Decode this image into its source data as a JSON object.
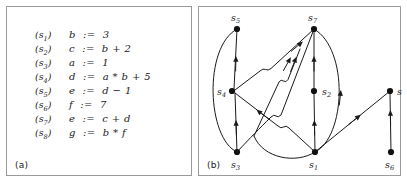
{
  "figure": {
    "panels": [
      {
        "id": "a",
        "label": "(a)"
      },
      {
        "id": "b",
        "label": "(b)"
      }
    ]
  },
  "statements": {
    "caption": "(a)",
    "rows": [
      {
        "tag": "s",
        "index": "1",
        "text": "b  :=  3"
      },
      {
        "tag": "s",
        "index": "2",
        "text": "c  :=  b + 2"
      },
      {
        "tag": "s",
        "index": "3",
        "text": "a  :=  1"
      },
      {
        "tag": "s",
        "index": "4",
        "text": "d  :=  a * b + 5"
      },
      {
        "tag": "s",
        "index": "5",
        "text": "e  :=  d − 1"
      },
      {
        "tag": "s",
        "index": "6",
        "text": "f  :=  7"
      },
      {
        "tag": "s",
        "index": "7",
        "text": "e  :=  c + d"
      },
      {
        "tag": "s",
        "index": "8",
        "text": "g  :=  b * f"
      }
    ]
  },
  "graph": {
    "caption": "(b)",
    "node_color": "#111111",
    "edge_color": "#1a1a1a",
    "nodes": [
      {
        "id": "s5",
        "label": "s",
        "sub": "5",
        "x": 38,
        "y": 22,
        "lx": 32,
        "ly": 13
      },
      {
        "id": "s7",
        "label": "s",
        "sub": "7",
        "x": 115,
        "y": 22,
        "lx": 109,
        "ly": 13
      },
      {
        "id": "s4",
        "label": "s",
        "sub": "4",
        "x": 33,
        "y": 84,
        "lx": 18,
        "ly": 88
      },
      {
        "id": "s2",
        "label": "s",
        "sub": "2",
        "x": 115,
        "y": 84,
        "lx": 122,
        "ly": 88
      },
      {
        "id": "s8",
        "label": "s",
        "sub": "8",
        "x": 191,
        "y": 84,
        "lx": 197,
        "ly": 88
      },
      {
        "id": "s3",
        "label": "s",
        "sub": "3",
        "x": 38,
        "y": 145,
        "lx": 32,
        "ly": 160
      },
      {
        "id": "s1",
        "label": "s",
        "sub": "1",
        "x": 116,
        "y": 145,
        "lx": 110,
        "ly": 160
      },
      {
        "id": "s6",
        "label": "s",
        "sub": "6",
        "x": 192,
        "y": 145,
        "lx": 186,
        "ly": 160
      }
    ],
    "edges": [
      {
        "from": "s3",
        "to": "s4",
        "kind": "line"
      },
      {
        "from": "s4",
        "to": "s5",
        "kind": "line"
      },
      {
        "from": "s3",
        "to": "s5",
        "kind": "curve-left"
      },
      {
        "from": "s1",
        "to": "s2",
        "kind": "line"
      },
      {
        "from": "s2",
        "to": "s7",
        "kind": "line"
      },
      {
        "from": "s1",
        "to": "s7",
        "kind": "curve-right"
      },
      {
        "from": "s6",
        "to": "s8",
        "kind": "line"
      },
      {
        "from": "s1",
        "to": "s8",
        "kind": "diagonal"
      },
      {
        "from": "s4",
        "to": "s7",
        "kind": "diagonal"
      },
      {
        "from": "s3",
        "to": "s7",
        "kind": "diagonal"
      },
      {
        "from": "s1",
        "to": "s4",
        "kind": "diagonal"
      },
      {
        "from": "s1",
        "to": "s5",
        "kind": "curve-under"
      }
    ]
  }
}
